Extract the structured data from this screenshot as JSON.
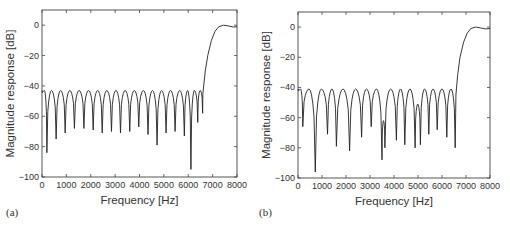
{
  "chart_data": [
    {
      "id": "a",
      "type": "line",
      "panel_label": "(a)",
      "title": "",
      "xlabel": "Frequency [Hz]",
      "ylabel": "Magnitude response [dB]",
      "xlim": [
        0,
        8000
      ],
      "ylim": [
        -100,
        10
      ],
      "xticks": [
        0,
        1000,
        2000,
        3000,
        4000,
        5000,
        6000,
        7000,
        8000
      ],
      "yticks": [
        0,
        -20,
        -40,
        -60,
        -80,
        -100
      ],
      "grid": false,
      "legend": null,
      "stopband_peak_db": -43,
      "nulls": [
        {
          "f": 200,
          "db": -84
        },
        {
          "f": 580,
          "db": -75
        },
        {
          "f": 950,
          "db": -71
        },
        {
          "f": 1330,
          "db": -68
        },
        {
          "f": 1720,
          "db": -68
        },
        {
          "f": 2100,
          "db": -69
        },
        {
          "f": 2470,
          "db": -71
        },
        {
          "f": 2850,
          "db": -70
        },
        {
          "f": 3220,
          "db": -71
        },
        {
          "f": 3600,
          "db": -70
        },
        {
          "f": 3970,
          "db": -67
        },
        {
          "f": 4350,
          "db": -72
        },
        {
          "f": 4720,
          "db": -79
        },
        {
          "f": 5090,
          "db": -71
        },
        {
          "f": 5460,
          "db": -70
        },
        {
          "f": 5840,
          "db": -73
        },
        {
          "f": 6110,
          "db": -95
        },
        {
          "f": 6390,
          "db": -64
        },
        {
          "f": 6590,
          "db": -58
        }
      ],
      "passband": [
        {
          "f": 6600,
          "db": -45
        },
        {
          "f": 6700,
          "db": -30
        },
        {
          "f": 6800,
          "db": -20
        },
        {
          "f": 6950,
          "db": -10
        },
        {
          "f": 7100,
          "db": -4
        },
        {
          "f": 7250,
          "db": -1
        },
        {
          "f": 7450,
          "db": 0
        },
        {
          "f": 7650,
          "db": -0.5
        },
        {
          "f": 7850,
          "db": -1.2
        },
        {
          "f": 8000,
          "db": -1
        }
      ]
    },
    {
      "id": "b",
      "type": "line",
      "panel_label": "(b)",
      "title": "",
      "xlabel": "Frequency [Hz]",
      "ylabel": "Magnitude response [dB]",
      "xlim": [
        0,
        8000
      ],
      "ylim": [
        -100,
        10
      ],
      "xticks": [
        0,
        1000,
        2000,
        3000,
        4000,
        5000,
        6000,
        7000,
        8000
      ],
      "yticks": [
        0,
        -20,
        -40,
        -60,
        -80,
        -100
      ],
      "grid": false,
      "legend": null,
      "stopband_peak_db": -41,
      "nulls": [
        {
          "f": 200,
          "db": -66
        },
        {
          "f": 720,
          "db": -96
        },
        {
          "f": 1230,
          "db": -71
        },
        {
          "f": 1600,
          "db": -79
        },
        {
          "f": 2150,
          "db": -82
        },
        {
          "f": 2650,
          "db": -73
        },
        {
          "f": 3050,
          "db": -66
        },
        {
          "f": 3500,
          "db": -88
        },
        {
          "f": 3620,
          "db": -80
        },
        {
          "f": 4100,
          "db": -75
        },
        {
          "f": 4450,
          "db": -78
        },
        {
          "f": 4880,
          "db": -80
        },
        {
          "f": 5100,
          "db": -78
        },
        {
          "f": 5450,
          "db": -71
        },
        {
          "f": 5800,
          "db": -68
        },
        {
          "f": 6200,
          "db": -73
        },
        {
          "f": 6550,
          "db": -80
        }
      ],
      "local_peaks": [
        {
          "f": 3560,
          "db": -62
        },
        {
          "f": 4990,
          "db": -51
        }
      ],
      "passband": [
        {
          "f": 6580,
          "db": -45
        },
        {
          "f": 6650,
          "db": -32
        },
        {
          "f": 6750,
          "db": -20
        },
        {
          "f": 6900,
          "db": -10
        },
        {
          "f": 7050,
          "db": -4
        },
        {
          "f": 7200,
          "db": -1
        },
        {
          "f": 7400,
          "db": 0
        },
        {
          "f": 7600,
          "db": -0.5
        },
        {
          "f": 7800,
          "db": -1.2
        },
        {
          "f": 8000,
          "db": -1
        }
      ]
    }
  ]
}
